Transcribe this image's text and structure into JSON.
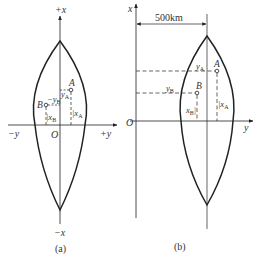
{
  "panel_a": {
    "caption": "(a)",
    "axis_x_pos": "+x",
    "axis_x_neg": "−x",
    "axis_y_pos": "+y",
    "axis_y_neg": "−y",
    "origin": "O",
    "point_a": "A",
    "point_b": "B",
    "y_a": "y",
    "y_a_sub": "A",
    "y_b": "−y",
    "y_b_sub": "B",
    "x_a": "x",
    "x_a_sub": "A",
    "x_b": "x",
    "x_b_sub": "B"
  },
  "panel_b": {
    "caption": "(b)",
    "axis_x": "x",
    "axis_y": "y",
    "origin": "O",
    "offset_label": "500km",
    "point_a": "A",
    "point_b": "B",
    "y_a": "y",
    "y_a_sub": "A",
    "y_b": "y",
    "y_b_sub": "B",
    "x_a": "x",
    "x_a_sub": "A",
    "x_b": "x",
    "x_b_sub": "B"
  },
  "colors": {
    "line": "#222222",
    "text": "#333333"
  }
}
